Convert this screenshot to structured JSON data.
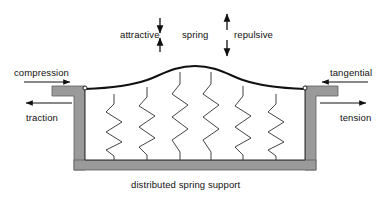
{
  "figure": {
    "title_caption": "distributed spring support",
    "labels": {
      "attractive": "attractive",
      "spring": "spring",
      "repulsive": "repulsive",
      "compression": "compression",
      "traction": "traction",
      "tangential": "tangential",
      "tension": "tension"
    }
  },
  "colors": {
    "line": "#1a1a1a",
    "wall_fill": "#9a9a9a",
    "wall_stroke": "#5a5a5a",
    "spring_stroke": "#3a3a3a",
    "background": "#ffffff",
    "pin_fill": "#ffffff"
  },
  "geometry": {
    "deformed_beam": {
      "left_anchor": [
        85,
        89
      ],
      "right_anchor": [
        305,
        89
      ],
      "peak": [
        195,
        66
      ],
      "description": "smooth hump / bell curve representing deformed beam top surface"
    },
    "springs": {
      "count": 6,
      "x_positions": [
        114,
        147,
        180,
        211,
        243,
        276
      ],
      "bottom_y": 160,
      "zigzag_cycles": 4
    },
    "walls": {
      "left_wall_x": [
        74,
        85
      ],
      "right_wall_x": [
        305,
        316
      ],
      "flange_top_y": 86,
      "flange_bottom_y": 96,
      "wall_bottom_y": 170,
      "base_y": [
        160,
        170
      ],
      "base_x": [
        74,
        316
      ]
    },
    "arrows": {
      "attractive": {
        "x": 160,
        "top_arrow": "down",
        "bottom_arrow": "up",
        "span_y": [
          18,
          52
        ]
      },
      "repulsive": {
        "x": 227,
        "top_arrow": "up",
        "bottom_arrow": "down",
        "span_y": [
          14,
          56
        ]
      },
      "compression": {
        "direction": "right",
        "x_range": [
          24,
          72
        ],
        "y": 82
      },
      "traction": {
        "direction": "left",
        "x_range": [
          24,
          72
        ],
        "y": 103
      },
      "tangential": {
        "direction": "left",
        "x_range": [
          320,
          368
        ],
        "y": 82
      },
      "tension": {
        "direction": "right",
        "x_range": [
          320,
          368
        ],
        "y": 103
      }
    }
  }
}
